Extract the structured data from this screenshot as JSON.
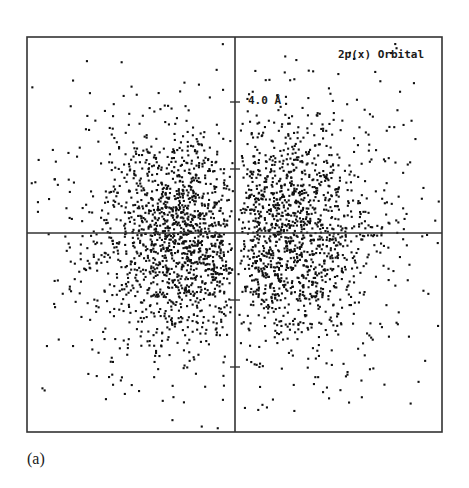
{
  "figure": {
    "caption": "(a)"
  },
  "chart_data": {
    "type": "scatter",
    "title": "2p(x) Orbital",
    "xlabel": "",
    "ylabel": "",
    "scale_label": "4.0 Å",
    "scale_label_note": "tick on vertical axis marks 4.0 Å from origin",
    "grid": false,
    "legend": null,
    "axes": {
      "frame": {
        "x0": 27,
        "y0": 37,
        "x1": 442,
        "y1": 432
      },
      "origin_px": {
        "x": 235,
        "y": 233
      },
      "vertical_axis_ticks_px": [
        102,
        169,
        300,
        367
      ],
      "tick_spacing_angstrom": 2.0
    },
    "series": [
      {
        "name": "negative x lobe",
        "center_px": {
          "x": 180,
          "y": 236
        },
        "spread_px": {
          "x": 42,
          "y": 50
        },
        "count": 1900
      },
      {
        "name": "positive x lobe",
        "center_px": {
          "x": 280,
          "y": 232
        },
        "spread_px": {
          "x": 45,
          "y": 52
        },
        "count": 1900
      }
    ],
    "colors": {
      "dots": "#111111",
      "axes": "#333333",
      "background": "#ffffff"
    }
  }
}
